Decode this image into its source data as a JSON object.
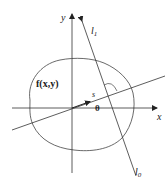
{
  "diagram": {
    "axes": {
      "x_label": "x",
      "y_label": "y"
    },
    "function_label": "f(x,y)",
    "s_label": "s",
    "theta_label": "θ",
    "line_top_label": "l",
    "line_top_sub": "1",
    "line_bottom_label": "l",
    "line_bottom_sub": "0",
    "colors": {
      "stroke": "#333333",
      "background": "#ffffff"
    }
  }
}
